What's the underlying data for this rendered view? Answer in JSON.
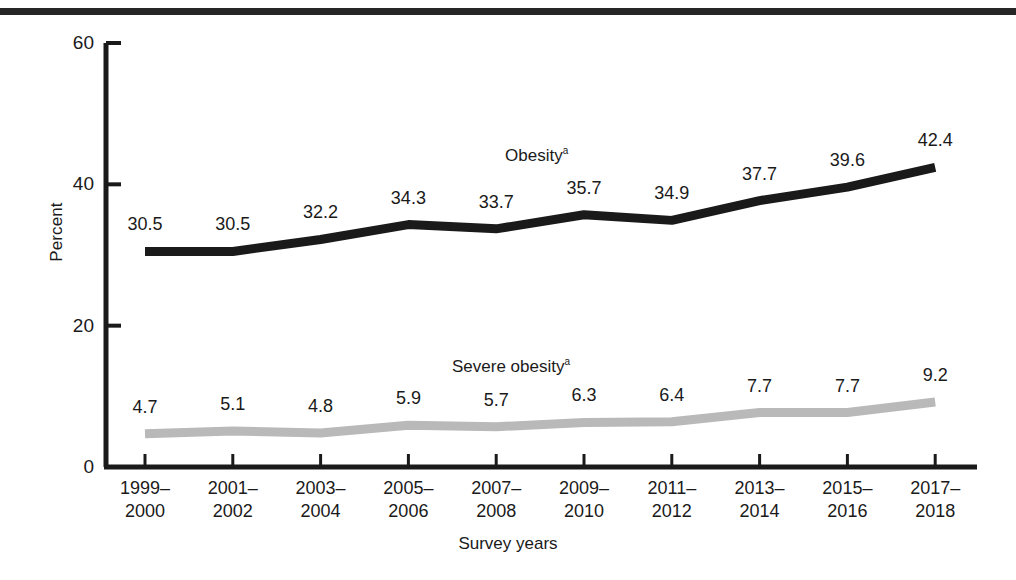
{
  "figure": {
    "y_axis_title": "Percent",
    "x_axis_title": "Survey years"
  },
  "chart_data": {
    "type": "line",
    "title": "",
    "xlabel": "Survey years",
    "ylabel": "Percent",
    "ylim": [
      0,
      60
    ],
    "yticks": [
      0,
      20,
      40,
      60
    ],
    "ytick_labels": [
      "0",
      "20",
      "40",
      "60"
    ],
    "grid": false,
    "legend_position": "inline-annotation",
    "categories": [
      "1999–\n2000",
      "2001–\n2002",
      "2003–\n2004",
      "2005–\n2006",
      "2007–\n2008",
      "2009–\n2010",
      "2011–\n2012",
      "2013–\n2014",
      "2015–\n2016",
      "2017–\n2018"
    ],
    "series": [
      {
        "name": "Obesity",
        "footnote_marker": "a",
        "color": "#1a1a1a",
        "values": [
          30.5,
          30.5,
          32.2,
          34.3,
          33.7,
          35.7,
          34.9,
          37.7,
          39.6,
          42.4
        ],
        "value_labels": [
          "30.5",
          "30.5",
          "32.2",
          "34.3",
          "33.7",
          "35.7",
          "34.9",
          "37.7",
          "39.6",
          "42.4"
        ]
      },
      {
        "name": "Severe obesity",
        "footnote_marker": "a",
        "color": "#b9b9b9",
        "values": [
          4.7,
          5.1,
          4.8,
          5.9,
          5.7,
          6.3,
          6.4,
          7.7,
          7.7,
          9.2
        ],
        "value_labels": [
          "4.7",
          "5.1",
          "4.8",
          "5.9",
          "5.7",
          "6.3",
          "6.4",
          "7.7",
          "7.7",
          "9.2"
        ]
      }
    ]
  }
}
